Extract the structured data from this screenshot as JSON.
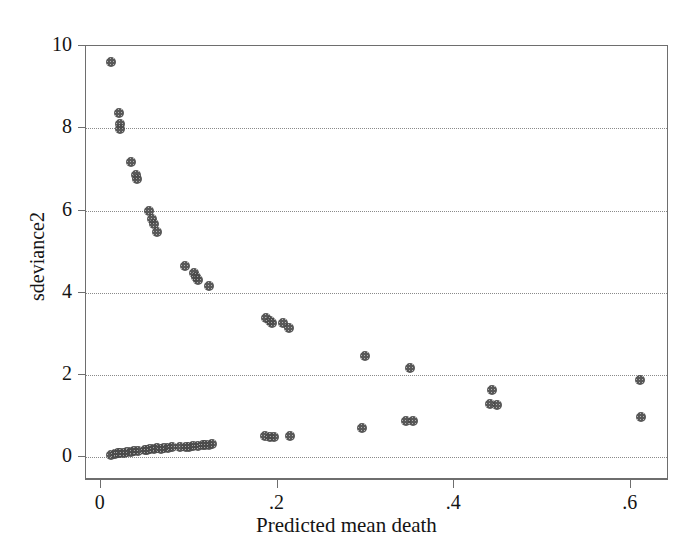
{
  "chart_data": {
    "type": "scatter",
    "title": "",
    "xlabel": "Predicted mean death",
    "ylabel": "sdeviance2",
    "xlim": [
      -0.0168,
      0.6432
    ],
    "ylim": [
      -0.553,
      10.0
    ],
    "xticks": [
      0,
      0.2,
      0.4,
      0.6
    ],
    "xtick_labels": [
      "0",
      ".2",
      ".4",
      ".6"
    ],
    "yticks": [
      0,
      2,
      4,
      6,
      8,
      10
    ],
    "ytick_labels": [
      "0",
      "2",
      "4",
      "6",
      "8",
      "10"
    ],
    "grid": "horizontal-dotted",
    "legend": "none",
    "marker": "filled-circle-gray",
    "marker_color": "#4a4a4a",
    "axis_color": "#6e6e6e",
    "grid_color": "#8a8a8a",
    "background": "#ffffff",
    "n_points": 62,
    "points": [
      {
        "x": 0.012,
        "y": 9.62
      },
      {
        "x": 0.021,
        "y": 8.36
      },
      {
        "x": 0.022,
        "y": 8.1
      },
      {
        "x": 0.022,
        "y": 7.98
      },
      {
        "x": 0.034,
        "y": 7.18
      },
      {
        "x": 0.04,
        "y": 6.86
      },
      {
        "x": 0.041,
        "y": 6.76
      },
      {
        "x": 0.055,
        "y": 5.98
      },
      {
        "x": 0.058,
        "y": 5.8
      },
      {
        "x": 0.06,
        "y": 5.68
      },
      {
        "x": 0.064,
        "y": 5.48
      },
      {
        "x": 0.095,
        "y": 4.66
      },
      {
        "x": 0.105,
        "y": 4.48
      },
      {
        "x": 0.108,
        "y": 4.38
      },
      {
        "x": 0.11,
        "y": 4.3
      },
      {
        "x": 0.122,
        "y": 4.16
      },
      {
        "x": 0.187,
        "y": 3.38
      },
      {
        "x": 0.191,
        "y": 3.32
      },
      {
        "x": 0.194,
        "y": 3.26
      },
      {
        "x": 0.206,
        "y": 3.26
      },
      {
        "x": 0.213,
        "y": 3.14
      },
      {
        "x": 0.299,
        "y": 2.46
      },
      {
        "x": 0.35,
        "y": 2.16
      },
      {
        "x": 0.443,
        "y": 1.64
      },
      {
        "x": 0.441,
        "y": 1.3
      },
      {
        "x": 0.448,
        "y": 1.26
      },
      {
        "x": 0.61,
        "y": 1.88
      },
      {
        "x": 0.612,
        "y": 0.98
      },
      {
        "x": 0.186,
        "y": 0.52
      },
      {
        "x": 0.192,
        "y": 0.5
      },
      {
        "x": 0.196,
        "y": 0.5
      },
      {
        "x": 0.214,
        "y": 0.52
      },
      {
        "x": 0.296,
        "y": 0.7
      },
      {
        "x": 0.346,
        "y": 0.88
      },
      {
        "x": 0.353,
        "y": 0.88
      },
      {
        "x": 0.012,
        "y": 0.06
      },
      {
        "x": 0.016,
        "y": 0.08
      },
      {
        "x": 0.019,
        "y": 0.1
      },
      {
        "x": 0.022,
        "y": 0.1
      },
      {
        "x": 0.03,
        "y": 0.12
      },
      {
        "x": 0.034,
        "y": 0.13
      },
      {
        "x": 0.038,
        "y": 0.14
      },
      {
        "x": 0.042,
        "y": 0.15
      },
      {
        "x": 0.052,
        "y": 0.18
      },
      {
        "x": 0.056,
        "y": 0.19
      },
      {
        "x": 0.06,
        "y": 0.21
      },
      {
        "x": 0.064,
        "y": 0.22
      },
      {
        "x": 0.072,
        "y": 0.22
      },
      {
        "x": 0.076,
        "y": 0.23
      },
      {
        "x": 0.08,
        "y": 0.24
      },
      {
        "x": 0.1,
        "y": 0.26
      },
      {
        "x": 0.104,
        "y": 0.27
      },
      {
        "x": 0.11,
        "y": 0.28
      },
      {
        "x": 0.116,
        "y": 0.3
      },
      {
        "x": 0.122,
        "y": 0.31
      },
      {
        "x": 0.126,
        "y": 0.32
      },
      {
        "x": 0.05,
        "y": 0.17
      },
      {
        "x": 0.068,
        "y": 0.21
      },
      {
        "x": 0.09,
        "y": 0.25
      },
      {
        "x": 0.096,
        "y": 0.26
      },
      {
        "x": 0.118,
        "y": 0.3
      },
      {
        "x": 0.026,
        "y": 0.11
      }
    ]
  }
}
